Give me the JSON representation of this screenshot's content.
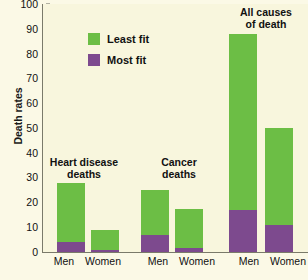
{
  "chart_data": {
    "type": "bar",
    "title": "",
    "xlabel": "",
    "ylabel": "Death rates",
    "ylim": [
      0,
      100
    ],
    "yticks": [
      0,
      10,
      20,
      30,
      40,
      50,
      60,
      70,
      80,
      90,
      100
    ],
    "grid": false,
    "stacked": true,
    "legend_position": "top-left-inside",
    "categories": [
      "Men",
      "Women",
      "Men",
      "Women",
      "Men",
      "Women"
    ],
    "groups": [
      {
        "name": "Heart disease\ndeaths",
        "categories": [
          "Men",
          "Women"
        ]
      },
      {
        "name": "Cancer\ndeaths",
        "categories": [
          "Men",
          "Women"
        ]
      },
      {
        "name": "All causes\nof death",
        "categories": [
          "Men",
          "Women"
        ]
      }
    ],
    "series": [
      {
        "name": "Least fit",
        "color": "#6cbe45",
        "values": [
          28,
          9,
          25,
          17.5,
          88,
          50
        ]
      },
      {
        "name": "Most fit",
        "color": "#7d4a8e",
        "values": [
          4,
          1,
          7,
          1.5,
          17,
          11
        ]
      }
    ],
    "annotations": [
      {
        "text": "Heart disease deaths",
        "group": 0
      },
      {
        "text": "Cancer deaths",
        "group": 1
      },
      {
        "text": "All causes of death",
        "group": 2
      }
    ]
  },
  "axis": {
    "y_title": "Death rates",
    "y_tick_labels": [
      "100",
      "90",
      "80",
      "70",
      "60",
      "50",
      "40",
      "30",
      "20",
      "10",
      "0"
    ],
    "x_tick_labels": [
      "Men",
      "Women",
      "Men",
      "Women",
      "Men",
      "Women"
    ]
  },
  "legend": {
    "items": [
      {
        "label": "Least fit",
        "color": "#6cbe45"
      },
      {
        "label": "Most fit",
        "color": "#7d4a8e"
      }
    ]
  },
  "group_labels": {
    "heart": "Heart disease\ndeaths",
    "cancer": "Cancer\ndeaths",
    "all": "All causes\nof death"
  },
  "colors": {
    "background": "#fbf9e6",
    "plot_background": "#f8f6dd",
    "least_fit": "#6cbe45",
    "most_fit": "#7d4a8e",
    "axis": "#7a7a6a"
  }
}
